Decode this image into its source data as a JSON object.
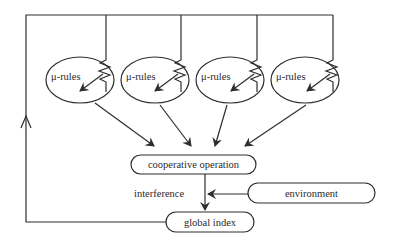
{
  "diagram": {
    "rule_nodes": [
      {
        "label": "μ-rules",
        "cx": 80,
        "cy": 80
      },
      {
        "label": "μ-rules",
        "cx": 155,
        "cy": 80
      },
      {
        "label": "μ-rules",
        "cx": 230,
        "cy": 80
      },
      {
        "label": "μ-rules",
        "cx": 305,
        "cy": 80
      }
    ],
    "cooperative_operation": {
      "label": "cooperative operation"
    },
    "environment": {
      "label": "environment"
    },
    "global_index": {
      "label": "global index"
    },
    "interference_label": "interference",
    "edges": [
      {
        "from": "μ-rules 1",
        "to": "cooperative operation"
      },
      {
        "from": "μ-rules 2",
        "to": "cooperative operation"
      },
      {
        "from": "μ-rules 3",
        "to": "cooperative operation"
      },
      {
        "from": "μ-rules 4",
        "to": "cooperative operation"
      },
      {
        "from": "cooperative operation",
        "to": "global index",
        "label": "interference"
      },
      {
        "from": "environment",
        "to": "interference edge"
      },
      {
        "from": "global index",
        "to": "μ-rules (feedback loop)"
      }
    ],
    "colors": {
      "line": "#2e2e2e",
      "text": "#2a2a2a",
      "background": "#ffffff"
    }
  }
}
